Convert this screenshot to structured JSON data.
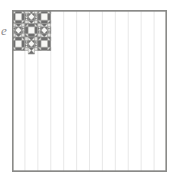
{
  "figure": {
    "margin_glyph": "e",
    "background_color": "#ffffff"
  },
  "quilt": {
    "name": "patchwork-quilt-diagram",
    "geometry": {
      "x": 12,
      "y": 10,
      "width": 155,
      "height": 162,
      "blocks_across": 3,
      "blocks_down": 3,
      "cells_per_block": 4,
      "total_cells_across": 12,
      "total_cells_down": 12
    },
    "palette": {
      "dark": "#6f6f6f",
      "mid": "#bdbdbb",
      "light": "#dededc",
      "pale": "#efefed",
      "white": "#f7f7f5",
      "line": "#9a9a98",
      "border": "#8a8a88"
    },
    "block_layout": [
      [
        "cross",
        "star",
        "cross"
      ],
      [
        "star",
        "cross",
        "star"
      ],
      [
        "cross",
        "star",
        "cross"
      ]
    ],
    "block_types": {
      "cross": {
        "label": "Greek cross / square-in-square block",
        "description": "Dark corner triangles with a dark cross frame around a pale center square"
      },
      "star": {
        "label": "Hourglass X / star block",
        "description": "Four dark triangles pointing inward forming an X over a pale square"
      }
    },
    "legend": [
      {
        "swatch": "dark",
        "label": "Dark fabric"
      },
      {
        "swatch": "mid",
        "label": "Medium fabric"
      },
      {
        "swatch": "light",
        "label": "Light fabric"
      },
      {
        "swatch": "pale",
        "label": "Pale fabric"
      }
    ]
  }
}
